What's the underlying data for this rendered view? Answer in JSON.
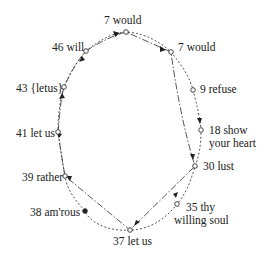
{
  "diagram": {
    "nodes": [
      {
        "id": "n7top",
        "label": "7 would",
        "x": 126,
        "y": 32,
        "style": "open"
      },
      {
        "id": "n7right",
        "label": "7 would",
        "x": 171,
        "y": 52,
        "style": "open"
      },
      {
        "id": "n46",
        "label": "46 will",
        "x": 86,
        "y": 51,
        "style": "open"
      },
      {
        "id": "n43",
        "label": "43 {letus}",
        "x": 64,
        "y": 87,
        "style": "open"
      },
      {
        "id": "n9",
        "label": "9 refuse",
        "x": 193,
        "y": 90,
        "style": "open"
      },
      {
        "id": "n41",
        "label": "41 let us",
        "x": 58,
        "y": 132,
        "style": "open"
      },
      {
        "id": "n18",
        "label": "18 show",
        "label2": "your heart",
        "x": 201,
        "y": 130,
        "style": "open"
      },
      {
        "id": "n30",
        "label": "30 lust",
        "x": 195,
        "y": 166,
        "style": "open"
      },
      {
        "id": "n39",
        "label": "39 rather",
        "x": 65,
        "y": 176,
        "style": "open"
      },
      {
        "id": "n35",
        "label": "35 thy",
        "label2": "willing soul",
        "x": 177,
        "y": 204,
        "style": "open"
      },
      {
        "id": "n38",
        "label": "38 am'rous",
        "x": 85,
        "y": 211,
        "style": "filled"
      },
      {
        "id": "n37",
        "label": "37 let us",
        "x": 130,
        "y": 230,
        "style": "open"
      }
    ],
    "line_styles": [
      "dotted",
      "dash-dot"
    ]
  }
}
